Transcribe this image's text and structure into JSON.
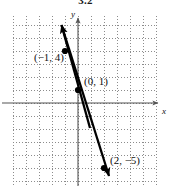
{
  "figure": {
    "number": "3.2",
    "width": 171,
    "height": 186
  },
  "axes": {
    "x_letter": "x",
    "y_letter": "y",
    "x_axis_pixel_y": 103,
    "y_axis_pixel_x": 78,
    "grid_spacing_px": 13,
    "grid_left_px": 13,
    "grid_top_px": 16,
    "grid_width_px": 144,
    "grid_height_px": 170
  },
  "chart_data": {
    "type": "line",
    "title": "3.2",
    "xlabel": "x",
    "ylabel": "y",
    "grid": true,
    "legend": "none",
    "xlim": [
      -5,
      6
    ],
    "ylim": [
      -6,
      6
    ],
    "equation": "y = -3x + 1",
    "slope": -3,
    "y_intercept": 1,
    "series": [
      {
        "name": "line",
        "x": [
          -1,
          0,
          2
        ],
        "y": [
          4,
          1,
          -5
        ]
      }
    ],
    "points": [
      {
        "label": "(−1, 4)",
        "x": -1,
        "y": 4,
        "px": 65,
        "py": 51
      },
      {
        "label": "(0, 1)",
        "x": 0,
        "y": 1,
        "px": 78,
        "py": 90
      },
      {
        "label": "(2, −5)",
        "x": 2,
        "y": -5,
        "px": 104,
        "py": 168
      }
    ],
    "line_endpoints_px": {
      "x1": 60,
      "y1": 22,
      "x2": 110,
      "y2": 180
    },
    "arrows": [
      "up-left-end",
      "down-right-end"
    ]
  },
  "colors": {
    "background": "#ffffff",
    "grid": "#8c8c8c",
    "axis": "#555555",
    "line": "#000000",
    "text": "#111111"
  }
}
